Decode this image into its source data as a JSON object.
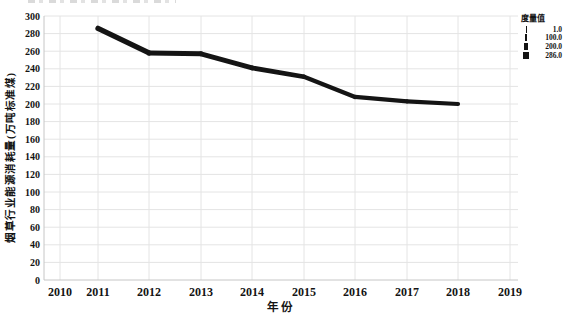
{
  "chart_data": {
    "type": "line",
    "title": "",
    "xlabel": "年份",
    "ylabel": "烟草行业能源消耗量(万吨标准煤)",
    "x": [
      2011,
      2012,
      2013,
      2014,
      2015,
      2016,
      2017,
      2018
    ],
    "values": [
      286,
      258,
      257,
      241,
      231,
      208,
      203,
      200
    ],
    "x_tick_labels": [
      "2010",
      "2011",
      "2012",
      "2013",
      "2014",
      "2015",
      "2016",
      "2017",
      "2018",
      "2019"
    ],
    "y_tick_labels": [
      "0",
      "20",
      "40",
      "60",
      "80",
      "100",
      "120",
      "140",
      "160",
      "180",
      "200",
      "220",
      "240",
      "260",
      "280",
      "300"
    ],
    "xlim": [
      2010,
      2019
    ],
    "ylim": [
      0,
      300
    ],
    "grid": true,
    "line_color": "#141414",
    "line_width_encoding": "value-mapped",
    "legend": {
      "title": "度量值",
      "position": "top-right",
      "encoding": "line-width",
      "entries": [
        {
          "label": "1.0",
          "weight": 1
        },
        {
          "label": "100.0",
          "weight": 2
        },
        {
          "label": "200.0",
          "weight": 3
        },
        {
          "label": "286.0",
          "weight": 4
        }
      ]
    }
  },
  "colors": {
    "background": "#ffffff",
    "grid": "#e4e4e4",
    "axis": "#c6c6c6",
    "text": "#141414",
    "line": "#141414"
  }
}
